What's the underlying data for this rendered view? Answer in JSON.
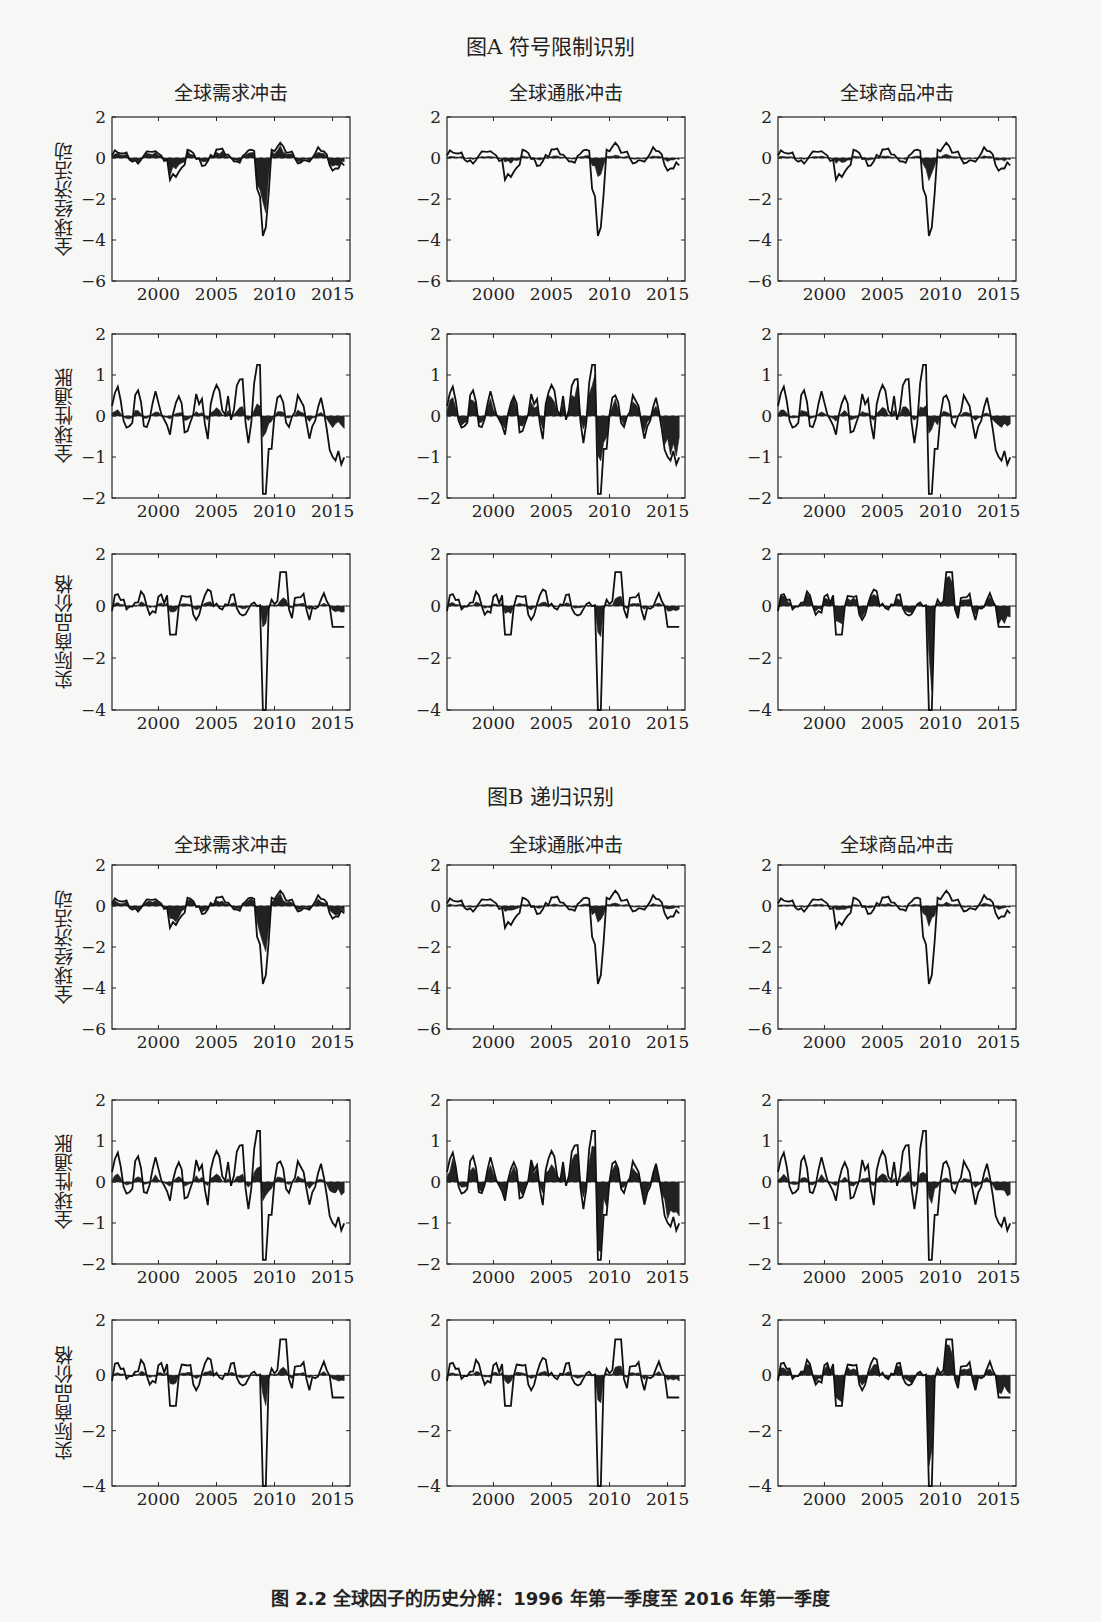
{
  "figure": {
    "panel_a_title": "图A  符号限制识别",
    "panel_b_title": "图B  递归识别",
    "caption": "图 2.2    全球因子的历史分解：1996 年第一季度至 2016 年第一季度"
  },
  "columns": [
    "全球需求冲击",
    "全球通胀冲击",
    "全球商品冲击"
  ],
  "rows": [
    "全球经济活动",
    "全球性通胀",
    "实际商品价格"
  ],
  "chart_data": {
    "type": "area",
    "title": "全球因子的历史分解：1996 年第一季度至 2016 年第一季度",
    "layout": "2 panels x 3 rows x 3 columns of small-multiple line+shaded-area plots",
    "x_ticks": [
      2000,
      2005,
      2010,
      2015
    ],
    "x_range": [
      1996,
      2016
    ],
    "row_axes": [
      {
        "row": "全球经济活动",
        "ylim": [
          -6,
          2
        ],
        "yticks": [
          2,
          0,
          -2,
          -4,
          -6
        ]
      },
      {
        "row": "全球性通胀",
        "ylim": [
          -2,
          2
        ],
        "yticks": [
          2,
          1,
          0,
          -1,
          -2
        ]
      },
      {
        "row": "实际商品价格",
        "ylim": [
          -4,
          2
        ],
        "yticks": [
          2,
          0,
          -2,
          -4
        ]
      }
    ],
    "legend": {
      "line": "实际序列（去均值）",
      "shaded": "该冲击的历史贡献"
    },
    "series_note": "Line = observed variable; shaded area = contribution of the column shock",
    "panels": [
      {
        "name": "图A 符号限制识别"
      },
      {
        "name": "图B 递归识别"
      }
    ],
    "key_values": {
      "全球经济活动_2009_trough": -4.2,
      "全球性通胀_2009_trough": -1.9,
      "全球性通胀_2008_peak": 1.25,
      "实际商品价格_2009_trough": -4.0,
      "实际商品价格_2011_peak": 1.3
    }
  }
}
